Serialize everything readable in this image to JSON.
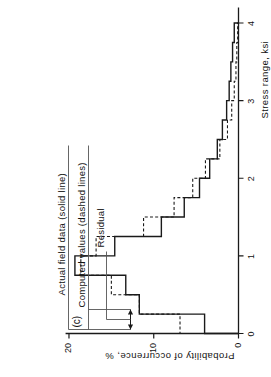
{
  "figure": {
    "panel_label": "(c)",
    "annotations": [
      {
        "name": "actual-field-data",
        "text": "Actual field data (solid line)"
      },
      {
        "name": "computed-values",
        "text": "Computed values (dashed lines)"
      },
      {
        "name": "residual",
        "text": "Residual"
      }
    ]
  },
  "chart_data": {
    "type": "bar",
    "title": "(c)",
    "orientation": "horizontal-rotated",
    "xlabel": "Stress range, ksi",
    "ylabel": "Probability of occurrence, %",
    "xlim": [
      0,
      4.2
    ],
    "ylim": [
      0,
      21
    ],
    "xticks": [
      0,
      1,
      2,
      3,
      4
    ],
    "xtick_labels": [
      "0",
      "1",
      "2",
      "3",
      "4"
    ],
    "yticks": [
      0,
      10,
      20
    ],
    "ytick_labels": [
      "0",
      "10",
      "20"
    ],
    "grid": false,
    "legend_position": "top-left-annotations",
    "bin_width": 0.25,
    "bin_edges": [
      0,
      0.25,
      0.5,
      0.75,
      1.0,
      1.25,
      1.5,
      1.75,
      2.0,
      2.25,
      2.5,
      2.75,
      3.0,
      3.25,
      3.5,
      3.75,
      4.0
    ],
    "series": [
      {
        "name": "Actual field data (solid line)",
        "style": "solid",
        "values": [
          4.0,
          11.7,
          13.3,
          19.3,
          14.6,
          9.1,
          6.4,
          4.6,
          3.4,
          2.5,
          1.9,
          1.4,
          1.1,
          0.9,
          0.7,
          0.5
        ]
      },
      {
        "name": "Computed values (dashed lines)",
        "style": "dashed",
        "values": [
          6.9,
          11.7,
          15.0,
          18.6,
          16.8,
          11.2,
          7.6,
          5.4,
          3.9,
          2.2,
          1.3,
          0.8,
          0.5,
          0.3,
          0.2,
          0.1
        ]
      }
    ],
    "annotations": [
      {
        "label": "Actual field data (solid line)"
      },
      {
        "label": "Computed values (dashed lines)"
      },
      {
        "label": "Residual"
      }
    ]
  },
  "colors": {
    "ink": "#1a1a1a",
    "background": "#ffffff"
  }
}
